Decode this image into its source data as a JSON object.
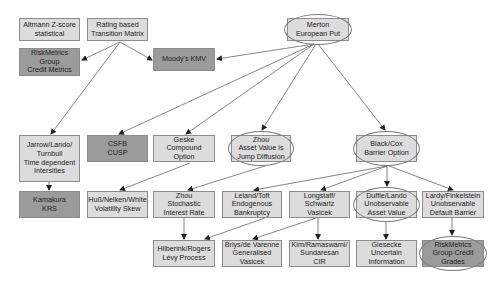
{
  "diagram": {
    "colors": {
      "light_fill": "#dcdcdc",
      "dark_fill": "#9b9b9b",
      "border": "#8c8c8c",
      "edge": "#666666"
    },
    "nodes": [
      {
        "id": "altmann",
        "label": "Altmann Z-score\nstatistical",
        "x": 19,
        "y": 18,
        "w": 61,
        "h": 23,
        "style": "light",
        "circled": false
      },
      {
        "id": "rating",
        "label": "Rating based\nTransition Matrix",
        "x": 87,
        "y": 18,
        "w": 61,
        "h": 23,
        "style": "light",
        "circled": false
      },
      {
        "id": "merton",
        "label": "Merton\nEuropean Put",
        "x": 287,
        "y": 18,
        "w": 62,
        "h": 23,
        "style": "light",
        "circled": true
      },
      {
        "id": "riskmetrics_cm",
        "label": "RiskMetrics\nGroup\nCredit Metrics",
        "x": 19,
        "y": 48,
        "w": 61,
        "h": 28,
        "style": "dark",
        "circled": false
      },
      {
        "id": "moodys",
        "label": "Moody's KMV",
        "x": 153,
        "y": 48,
        "w": 62,
        "h": 23,
        "style": "dark",
        "circled": false
      },
      {
        "id": "jarrow",
        "label": "Jarrow/Lando/\nTurnbull\nTime dependent\nIntersities",
        "x": 19,
        "y": 135,
        "w": 61,
        "h": 47,
        "style": "light",
        "circled": false
      },
      {
        "id": "csfb",
        "label": "CSFB\nCUSP",
        "x": 87,
        "y": 135,
        "w": 61,
        "h": 27,
        "style": "dark",
        "circled": false
      },
      {
        "id": "geske",
        "label": "Geske\nCompound\nOption",
        "x": 153,
        "y": 135,
        "w": 62,
        "h": 27,
        "style": "light",
        "circled": false
      },
      {
        "id": "zhou_jump",
        "label": "Zhou\nAsset Value is\nJump Diffusion",
        "x": 231,
        "y": 135,
        "w": 60,
        "h": 27,
        "style": "light",
        "circled": true
      },
      {
        "id": "blackcox",
        "label": "Black/Cox\nBarrier Option",
        "x": 356,
        "y": 135,
        "w": 61,
        "h": 27,
        "style": "light",
        "circled": true
      },
      {
        "id": "kamakura",
        "label": "Kamakura\nKRS",
        "x": 19,
        "y": 191,
        "w": 61,
        "h": 27,
        "style": "dark",
        "circled": false
      },
      {
        "id": "huss",
        "label": "Huß/Nelken/White\nVolatility Skew",
        "x": 87,
        "y": 191,
        "w": 61,
        "h": 27,
        "style": "light",
        "circled": false
      },
      {
        "id": "zhou_stoch",
        "label": "Zhou\nStochastic\nInterest Rate",
        "x": 153,
        "y": 191,
        "w": 62,
        "h": 27,
        "style": "light",
        "circled": false
      },
      {
        "id": "leland",
        "label": "Leland/Toft\nEndogenous\nBankruptcy",
        "x": 222,
        "y": 191,
        "w": 60,
        "h": 27,
        "style": "light",
        "circled": false
      },
      {
        "id": "longstaff",
        "label": "Longstaff/\nSchwartz\nVasicek",
        "x": 289,
        "y": 191,
        "w": 61,
        "h": 27,
        "style": "light",
        "circled": false
      },
      {
        "id": "duffie",
        "label": "Duffie/Lando\nUnobservable\nAsset Value",
        "x": 356,
        "y": 191,
        "w": 61,
        "h": 27,
        "style": "light",
        "circled": true
      },
      {
        "id": "lardy",
        "label": "Lardy/Finkelstein\nUnobservable\nDefault Barrier",
        "x": 422,
        "y": 191,
        "w": 62,
        "h": 27,
        "style": "light",
        "circled": false
      },
      {
        "id": "hilberink",
        "label": "Hilberink/Rogers\nLévy Process",
        "x": 153,
        "y": 240,
        "w": 62,
        "h": 27,
        "style": "light",
        "circled": false
      },
      {
        "id": "briys",
        "label": "Briys/de Varenne\nGeneralised\nVasicek",
        "x": 222,
        "y": 240,
        "w": 60,
        "h": 27,
        "style": "light",
        "circled": false
      },
      {
        "id": "kim",
        "label": "Kim/Ramaswami/\nSundaresan\nCIR",
        "x": 289,
        "y": 240,
        "w": 61,
        "h": 27,
        "style": "light",
        "circled": false
      },
      {
        "id": "giesecke",
        "label": "Giesecke\nUncertain\nInformation",
        "x": 356,
        "y": 240,
        "w": 61,
        "h": 27,
        "style": "light",
        "circled": false
      },
      {
        "id": "riskmetrics_grades",
        "label": "RiskMetrics\nGroup Credit\nGrades",
        "x": 422,
        "y": 240,
        "w": 62,
        "h": 27,
        "style": "dark",
        "circled": true
      }
    ],
    "edges": [
      {
        "from": "rating",
        "to": "riskmetrics_cm",
        "x1": 120,
        "y1": 42,
        "x2": 82,
        "y2": 60
      },
      {
        "from": "rating",
        "to": "moodys",
        "x1": 120,
        "y1": 42,
        "x2": 152,
        "y2": 60
      },
      {
        "from": "rating",
        "to": "jarrow",
        "x1": 120,
        "y1": 42,
        "x2": 51,
        "y2": 134
      },
      {
        "from": "merton",
        "to": "moodys",
        "x1": 314,
        "y1": 44,
        "x2": 217,
        "y2": 59
      },
      {
        "from": "merton",
        "to": "csfb",
        "x1": 314,
        "y1": 44,
        "x2": 119,
        "y2": 134
      },
      {
        "from": "merton",
        "to": "geske",
        "x1": 314,
        "y1": 44,
        "x2": 186,
        "y2": 134
      },
      {
        "from": "merton",
        "to": "zhou_jump",
        "x1": 316,
        "y1": 44,
        "x2": 262,
        "y2": 130
      },
      {
        "from": "merton",
        "to": "blackcox",
        "x1": 318,
        "y1": 44,
        "x2": 385,
        "y2": 130
      },
      {
        "from": "jarrow",
        "to": "kamakura",
        "x1": 49,
        "y1": 182,
        "x2": 49,
        "y2": 190
      },
      {
        "from": "geske",
        "to": "huss",
        "x1": 190,
        "y1": 163,
        "x2": 120,
        "y2": 190
      },
      {
        "from": "zhou_jump",
        "to": "zhou_stoch",
        "x1": 265,
        "y1": 166,
        "x2": 188,
        "y2": 190
      },
      {
        "from": "blackcox",
        "to": "leland",
        "x1": 387,
        "y1": 166,
        "x2": 254,
        "y2": 190
      },
      {
        "from": "blackcox",
        "to": "longstaff",
        "x1": 387,
        "y1": 166,
        "x2": 321,
        "y2": 190
      },
      {
        "from": "blackcox",
        "to": "duffie",
        "x1": 387,
        "y1": 166,
        "x2": 387,
        "y2": 186
      },
      {
        "from": "blackcox",
        "to": "lardy",
        "x1": 389,
        "y1": 166,
        "x2": 453,
        "y2": 190
      },
      {
        "from": "zhou_stoch",
        "to": "hilberink",
        "x1": 184,
        "y1": 218,
        "x2": 184,
        "y2": 239
      },
      {
        "from": "leland",
        "to": "hilberink",
        "x1": 265,
        "y1": 218,
        "x2": 205,
        "y2": 239
      },
      {
        "from": "longstaff",
        "to": "briys",
        "x1": 316,
        "y1": 218,
        "x2": 253,
        "y2": 239
      },
      {
        "from": "longstaff",
        "to": "kim",
        "x1": 318,
        "y1": 218,
        "x2": 318,
        "y2": 239
      },
      {
        "from": "duffie",
        "to": "giesecke",
        "x1": 386,
        "y1": 222,
        "x2": 386,
        "y2": 239
      },
      {
        "from": "lardy",
        "to": "riskmetrics_grades",
        "x1": 452,
        "y1": 218,
        "x2": 452,
        "y2": 235
      }
    ]
  }
}
